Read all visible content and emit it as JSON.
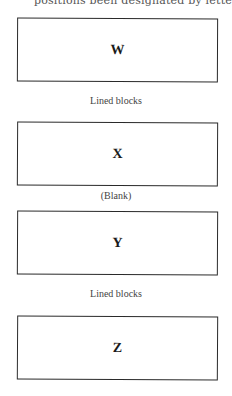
{
  "header": {
    "clipped_text": "positions been designated by lette"
  },
  "blocks": [
    {
      "label": "W"
    },
    {
      "label": "X"
    },
    {
      "label": "Y"
    },
    {
      "label": "Z"
    }
  ],
  "captions": [
    "Lined blocks",
    "(Blank)",
    "Lined blocks"
  ]
}
